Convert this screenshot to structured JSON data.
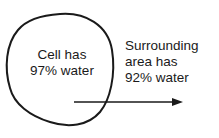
{
  "diagram": {
    "cell": {
      "line1": "Cell has",
      "line2": "97% water"
    },
    "surrounding": {
      "line1": "Surrounding",
      "line2": "area has",
      "line3": "92% water"
    },
    "colors": {
      "stroke": "#1a1a1a",
      "background": "#ffffff"
    }
  }
}
